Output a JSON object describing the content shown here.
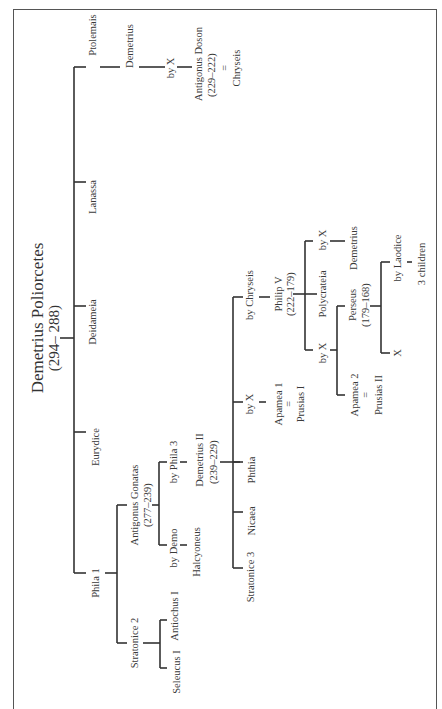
{
  "diagram": {
    "title": "Demetrius Poliorcetes",
    "title_dates": "(294– 288)",
    "orientation": "rotated-90-ccw",
    "wives": [
      {
        "name": "Phila 1"
      },
      {
        "name": "Eurydice"
      },
      {
        "name": "Deidameia"
      },
      {
        "name": "Lanassa"
      },
      {
        "name": "Ptolemais"
      }
    ],
    "ptolemais_line": {
      "son": "Demetrius",
      "by": "by X",
      "grandson": "Antigonus Doson",
      "grandson_dates": "(229–222)",
      "eq": "=",
      "spouse": "Chryseis"
    },
    "phila_line": {
      "daughter": "Stratonice 2",
      "daughter_spouses": [
        "Seleucus I",
        "Antiochus I"
      ],
      "son": "Antigonus Gonatas",
      "son_dates": "(277–239)",
      "by_demo": "by Demo",
      "halcyoneus": "Halcyoneus",
      "by_phila3": "by Phila 3",
      "demetrius2": "Demetrius II",
      "demetrius2_dates": "(239–229)"
    },
    "demetrius2_children": {
      "stratonice3": "Stratonice 3",
      "nicaea": "Nicaea",
      "phthia": "Phthia",
      "by_x": "by X",
      "apamea1": "Apamea 1",
      "apamea1_eq": "=",
      "prusias1": "Prusias I",
      "by_chryseis": "by Chryseis",
      "philip5": "Philip V",
      "philip5_dates": "(222–179)"
    },
    "philip5_children": {
      "by_x_left": "by X",
      "polycrateia": "Polycrateia",
      "by_x_right": "by X",
      "demetrius": "Demetrius",
      "apamea2": "Apamea 2",
      "apamea2_eq": "=",
      "prusias2": "Prusias II",
      "perseus": "Perseus",
      "perseus_dates": "(179–168)",
      "x": "X",
      "by_laodice": "by Laodice",
      "three_children": "3 children"
    }
  }
}
